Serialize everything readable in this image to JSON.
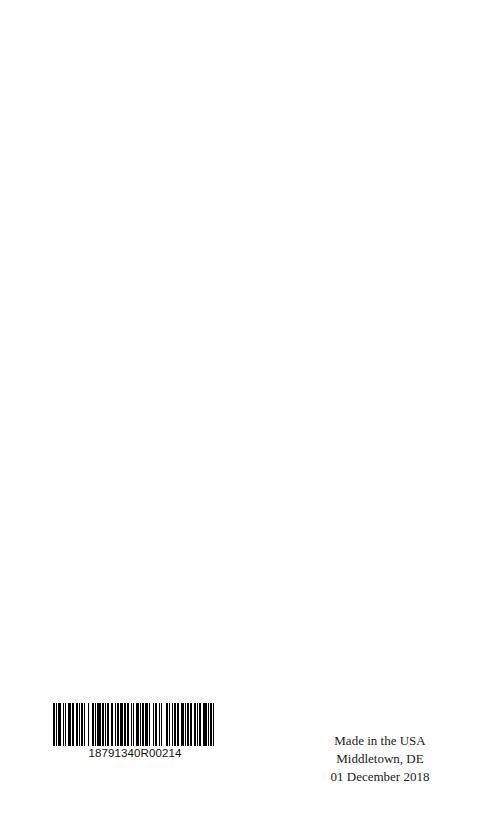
{
  "barcode": {
    "code": "18791340R00214",
    "bar_color": "#000000",
    "pattern": [
      2,
      1,
      1,
      1,
      2,
      2,
      1,
      1,
      1,
      2,
      3,
      1,
      1,
      2,
      2,
      1,
      1,
      1,
      2,
      1,
      1,
      2,
      1,
      3,
      2,
      1,
      1,
      1,
      3,
      1,
      2,
      1,
      1,
      1,
      2,
      2,
      1,
      2,
      1,
      1,
      2,
      1,
      3,
      1,
      1,
      1,
      2,
      2,
      1,
      1,
      1,
      2,
      2,
      1,
      1,
      1,
      2,
      1,
      3,
      1,
      1,
      2,
      1,
      1,
      2,
      2,
      1,
      1,
      1,
      3,
      2,
      1,
      1,
      2,
      1,
      1,
      2,
      1,
      1,
      2,
      3,
      1,
      1,
      1,
      2,
      1,
      1,
      2,
      2,
      1,
      1,
      1,
      2,
      2,
      3,
      1,
      1,
      1,
      2,
      1,
      1,
      2
    ]
  },
  "imprint": {
    "line1": "Made in the USA",
    "line2": "Middletown, DE",
    "line3": "01 December 2018"
  }
}
